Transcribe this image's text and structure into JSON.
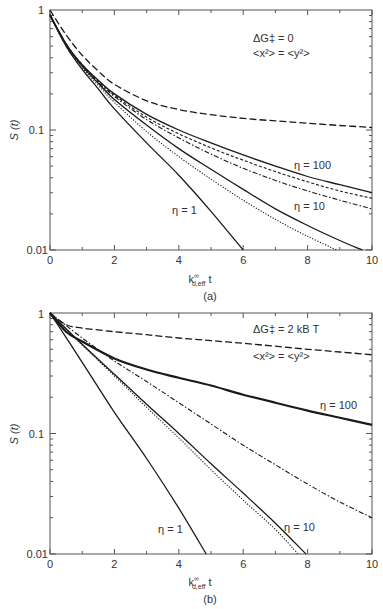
{
  "chart_data": [
    {
      "type": "line",
      "panel_label": "(a)",
      "xlabel": "k∞d,eff t",
      "ylabel": "S(t)",
      "yscale": "log",
      "xlim": [
        0,
        10
      ],
      "ylim": [
        0.01,
        1
      ],
      "x_ticks": [
        "0",
        "2",
        "4",
        "6",
        "8",
        "10"
      ],
      "y_ticks": [
        "0.01",
        "0.1",
        "1"
      ],
      "annotations": [
        "ΔG‡ = 0",
        "<x²> = <y²>",
        "η = 1",
        "η = 10",
        "η = 100"
      ],
      "grid": false,
      "series": [
        {
          "name": "long-dash (reference)",
          "style": "long-dash",
          "x": [
            0,
            0.5,
            1,
            1.5,
            2,
            3,
            4,
            5,
            6,
            7,
            8,
            9,
            10
          ],
          "y": [
            1,
            0.62,
            0.42,
            0.31,
            0.24,
            0.175,
            0.148,
            0.134,
            0.125,
            0.119,
            0.114,
            0.109,
            0.105
          ]
        },
        {
          "name": "η = 100 solid",
          "style": "solid",
          "x": [
            0,
            0.5,
            1,
            1.5,
            2,
            3,
            4,
            5,
            6,
            7,
            8,
            9,
            10
          ],
          "y": [
            0.92,
            0.52,
            0.35,
            0.26,
            0.2,
            0.135,
            0.1,
            0.078,
            0.062,
            0.05,
            0.041,
            0.035,
            0.03
          ]
        },
        {
          "name": "η = 100 short-dash",
          "style": "short-dash",
          "x": [
            0,
            0.5,
            1,
            1.5,
            2,
            3,
            4,
            5,
            6,
            7,
            8,
            9,
            10
          ],
          "y": [
            0.9,
            0.52,
            0.35,
            0.255,
            0.195,
            0.128,
            0.093,
            0.071,
            0.056,
            0.045,
            0.037,
            0.031,
            0.027
          ]
        },
        {
          "name": "η = 10 dash-dot",
          "style": "dash-dot",
          "x": [
            0,
            0.5,
            1,
            1.5,
            2,
            3,
            4,
            5,
            6,
            7,
            8,
            9,
            10
          ],
          "y": [
            0.9,
            0.52,
            0.34,
            0.25,
            0.19,
            0.122,
            0.086,
            0.063,
            0.048,
            0.038,
            0.031,
            0.026,
            0.022
          ]
        },
        {
          "name": "η = 10 solid",
          "style": "solid",
          "x": [
            0,
            0.5,
            1,
            1.5,
            2,
            3,
            4,
            5,
            6,
            7,
            8,
            9,
            9.7
          ],
          "y": [
            0.9,
            0.52,
            0.34,
            0.245,
            0.18,
            0.11,
            0.07,
            0.047,
            0.032,
            0.022,
            0.016,
            0.012,
            0.01
          ]
        },
        {
          "name": "η = 1 dotted",
          "style": "dotted",
          "x": [
            0,
            0.5,
            1,
            1.5,
            2,
            3,
            4,
            5,
            6,
            7,
            8,
            8.9
          ],
          "y": [
            0.9,
            0.5,
            0.33,
            0.235,
            0.17,
            0.097,
            0.06,
            0.039,
            0.026,
            0.018,
            0.013,
            0.01
          ]
        },
        {
          "name": "η = 1 solid",
          "style": "solid",
          "x": [
            0,
            0.5,
            1,
            1.5,
            2,
            3,
            4,
            5,
            6
          ],
          "y": [
            0.9,
            0.5,
            0.32,
            0.22,
            0.15,
            0.078,
            0.042,
            0.021,
            0.01
          ]
        }
      ]
    },
    {
      "type": "line",
      "panel_label": "(b)",
      "xlabel": "k∞d,eff t",
      "ylabel": "S(t)",
      "yscale": "log",
      "xlim": [
        0,
        10
      ],
      "ylim": [
        0.01,
        1
      ],
      "x_ticks": [
        "0",
        "2",
        "4",
        "6",
        "8",
        "10"
      ],
      "y_ticks": [
        "0.01",
        "0.1",
        "1"
      ],
      "annotations": [
        "ΔG‡ = 2 kB T",
        "<x²> = <y²>",
        "η = 1",
        "η = 10",
        "η = 100"
      ],
      "grid": false,
      "series": [
        {
          "name": "long-dash (reference)",
          "style": "long-dash",
          "x": [
            0,
            0.5,
            1,
            2,
            3,
            4,
            5,
            6,
            7,
            8,
            9,
            10
          ],
          "y": [
            1,
            0.8,
            0.75,
            0.7,
            0.66,
            0.62,
            0.59,
            0.56,
            0.53,
            0.5,
            0.475,
            0.45
          ]
        },
        {
          "name": "η = 100 solid",
          "style": "solid-thick",
          "x": [
            0,
            0.5,
            1,
            2,
            3,
            4,
            5,
            6,
            7,
            8,
            9,
            10
          ],
          "y": [
            1,
            0.7,
            0.58,
            0.42,
            0.34,
            0.29,
            0.25,
            0.21,
            0.18,
            0.155,
            0.135,
            0.118
          ]
        },
        {
          "name": "η = 10 dash-dot",
          "style": "dash-dot",
          "x": [
            0,
            1,
            2,
            3,
            4,
            5,
            6,
            7,
            8,
            9,
            10
          ],
          "y": [
            1,
            0.62,
            0.4,
            0.27,
            0.18,
            0.12,
            0.08,
            0.055,
            0.038,
            0.027,
            0.02
          ]
        },
        {
          "name": "η = 10 solid",
          "style": "solid",
          "x": [
            0,
            1,
            2,
            3,
            4,
            5,
            6,
            7,
            7.95
          ],
          "y": [
            1,
            0.55,
            0.31,
            0.175,
            0.1,
            0.056,
            0.032,
            0.018,
            0.01
          ]
        },
        {
          "name": "η = 1 dotted",
          "style": "dotted",
          "x": [
            0,
            1,
            2,
            3,
            4,
            5,
            6,
            7,
            7.7
          ],
          "y": [
            1,
            0.54,
            0.3,
            0.165,
            0.092,
            0.05,
            0.028,
            0.016,
            0.01
          ]
        },
        {
          "name": "η = 1 solid",
          "style": "solid",
          "x": [
            0,
            1,
            2,
            3,
            4,
            4.85
          ],
          "y": [
            1,
            0.39,
            0.15,
            0.062,
            0.024,
            0.01
          ]
        }
      ]
    }
  ],
  "panels": [
    {
      "label": "(a)",
      "ylabel": "S (t)",
      "xlabel_main": "k",
      "xlabel_sup": "∞",
      "xlabel_sub": "d,eff",
      "xlabel_tail": "t",
      "annot1": "ΔG‡ = 0",
      "annot2": "<x²> = <y²>",
      "eta1": "η = 1",
      "eta10": "η = 10",
      "eta100": "η = 100"
    },
    {
      "label": "(b)",
      "ylabel": "S (t)",
      "xlabel_main": "k",
      "xlabel_sup": "∞",
      "xlabel_sub": "d,eff",
      "xlabel_tail": "t",
      "annot1": "ΔG‡ = 2 kB T",
      "annot2": "<x²> = <y²>",
      "eta1": "η = 1",
      "eta10": "η = 10",
      "eta100": "η = 100"
    }
  ],
  "colors": {
    "line": "#1a1a1a",
    "frame": "#555555",
    "text": "#333333"
  }
}
